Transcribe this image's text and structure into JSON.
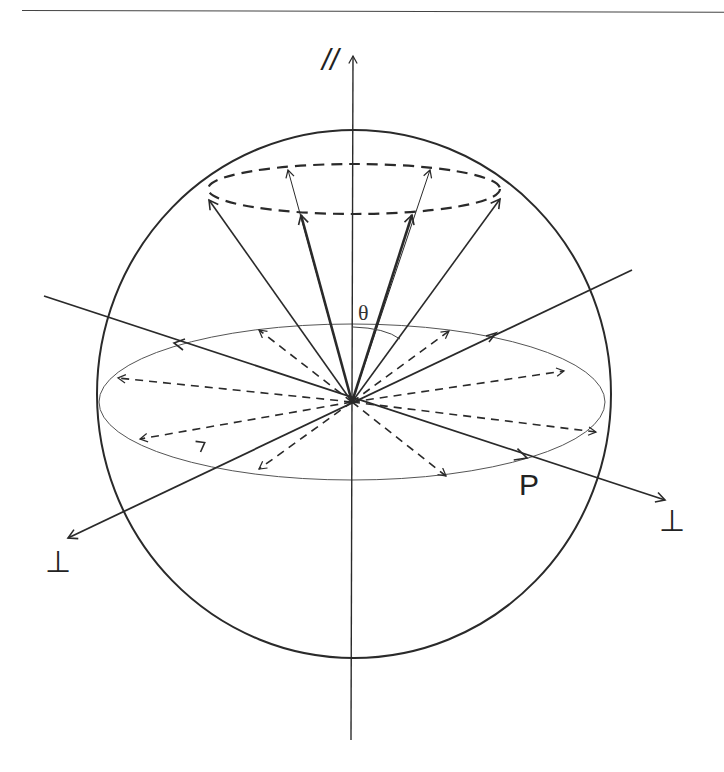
{
  "figure": {
    "type": "polarization-sphere-diagram",
    "labels": {
      "parallel_axis": "//",
      "perp_axis_right": "⊥",
      "perp_axis_left": "⊥",
      "angle": "θ",
      "point": "P"
    },
    "elements": {
      "sphere": "large outer circle representing unit sphere",
      "equator": "thin ellipse (equatorial plane)",
      "cone_rim": "dashed ellipse near top (cone of angle θ around parallel axis)",
      "solid_vectors_to_cone": 6,
      "dashed_vectors_in_equator": 8,
      "axes": [
        "vertical parallel axis",
        "perpendicular axis (lower-left ↔ upper-right)",
        "perpendicular axis (upper-left ↔ lower-right)"
      ]
    },
    "colors": {
      "stroke": "#2a2a2a",
      "thin_stroke": "#555555",
      "background": "#ffffff"
    }
  }
}
